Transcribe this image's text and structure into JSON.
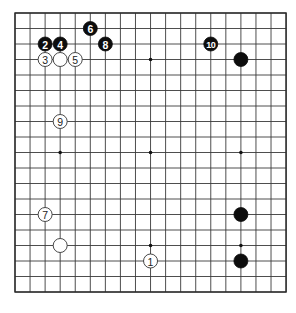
{
  "board": {
    "size": 19,
    "origin_x": 15,
    "origin_y": 13,
    "spacing_x": 15.06,
    "spacing_y": 15.5,
    "stone_radius": 7,
    "colors": {
      "background": "#ffffff",
      "line": "#3a3a3a",
      "black_stone": "#0d0d0d",
      "white_stone": "#ffffff",
      "white_stone_outline": "#333333"
    },
    "star_points": [
      [
        3,
        3
      ],
      [
        9,
        3
      ],
      [
        15,
        3
      ],
      [
        3,
        9
      ],
      [
        9,
        9
      ],
      [
        15,
        9
      ],
      [
        3,
        15
      ],
      [
        9,
        15
      ],
      [
        15,
        15
      ]
    ]
  },
  "stones": [
    {
      "color": "white",
      "col": 9,
      "row": 16,
      "label": "1"
    },
    {
      "color": "black",
      "col": 2,
      "row": 2,
      "label": "2"
    },
    {
      "color": "white",
      "col": 2,
      "row": 3,
      "label": "3"
    },
    {
      "color": "black",
      "col": 3,
      "row": 2,
      "label": "4"
    },
    {
      "color": "white",
      "col": 4,
      "row": 3,
      "label": "5"
    },
    {
      "color": "black",
      "col": 5,
      "row": 1,
      "label": "6"
    },
    {
      "color": "white",
      "col": 2,
      "row": 13,
      "label": "7"
    },
    {
      "color": "black",
      "col": 6,
      "row": 2,
      "label": "8"
    },
    {
      "color": "white",
      "col": 3,
      "row": 7,
      "label": "9"
    },
    {
      "color": "black",
      "col": 13,
      "row": 2,
      "label": "10"
    },
    {
      "color": "white",
      "col": 3,
      "row": 3,
      "label": ""
    },
    {
      "color": "black",
      "col": 15,
      "row": 3,
      "label": ""
    },
    {
      "color": "white",
      "col": 3,
      "row": 15,
      "label": ""
    },
    {
      "color": "black",
      "col": 15,
      "row": 13,
      "label": ""
    },
    {
      "color": "black",
      "col": 15,
      "row": 16,
      "label": ""
    }
  ]
}
